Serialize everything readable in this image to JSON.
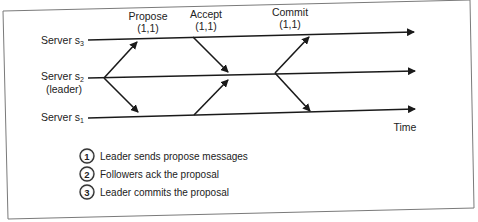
{
  "diagram": {
    "type": "sequence-timeline",
    "servers": [
      {
        "id": "s3",
        "label": "Server s",
        "sub": "3",
        "note": ""
      },
      {
        "id": "s2",
        "label": "Server s",
        "sub": "2",
        "note": "(leader)"
      },
      {
        "id": "s1",
        "label": "Server s",
        "sub": "1",
        "note": ""
      }
    ],
    "phases": [
      {
        "name": "Propose",
        "tuple": "(1,1)"
      },
      {
        "name": "Accept",
        "tuple": "(1,1)"
      },
      {
        "name": "Commit",
        "tuple": "(1,1)"
      }
    ],
    "axis_label": "Time",
    "legend": [
      {
        "num": "1",
        "text": "Leader sends propose messages"
      },
      {
        "num": "2",
        "text": "Followers ack the proposal"
      },
      {
        "num": "3",
        "text": "Leader commits the proposal"
      }
    ],
    "colors": {
      "line": "#1a1a1a",
      "border": "#7a7a7a",
      "background": "#ffffff"
    }
  }
}
